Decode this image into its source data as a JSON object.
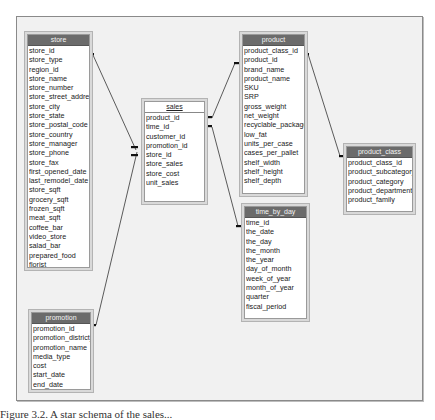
{
  "diagram": {
    "tables": {
      "store": {
        "title": "store",
        "fields": [
          "store_id",
          "store_type",
          "region_id",
          "store_name",
          "store_number",
          "store_street_address",
          "store_city",
          "store_state",
          "store_postal_code",
          "store_country",
          "store_manager",
          "store_phone",
          "store_fax",
          "first_opened_date",
          "last_remodel_date",
          "store_sqft",
          "grocery_sqft",
          "frozen_sqft",
          "meat_sqft",
          "coffee_bar",
          "video_store",
          "salad_bar",
          "prepared_food",
          "florist"
        ]
      },
      "promotion": {
        "title": "promotion",
        "fields": [
          "promotion_id",
          "promotion_district_id",
          "promotion_name",
          "media_type",
          "cost",
          "start_date",
          "end_date"
        ]
      },
      "sales": {
        "title": "sales",
        "fields": [
          "product_id",
          "time_id",
          "customer_id",
          "promotion_id",
          "store_id",
          "store_sales",
          "store_cost",
          "unit_sales"
        ]
      },
      "product": {
        "title": "product",
        "fields": [
          "product_class_id",
          "product_id",
          "brand_name",
          "product_name",
          "SKU",
          "SRP",
          "gross_weight",
          "net_weight",
          "recyclable_package",
          "low_fat",
          "units_per_case",
          "cases_per_pallet",
          "shelf_width",
          "shelf_height",
          "shelf_depth"
        ]
      },
      "time_by_day": {
        "title": "time_by_day",
        "fields": [
          "time_id",
          "the_date",
          "the_day",
          "the_month",
          "the_year",
          "day_of_month",
          "week_of_year",
          "month_of_year",
          "quarter",
          "fiscal_period"
        ]
      },
      "product_class": {
        "title": "product_class",
        "fields": [
          "product_class_id",
          "product_subcategory",
          "product_category",
          "product_department",
          "product_family"
        ]
      }
    },
    "relationships": [
      {
        "from": "store.store_id",
        "to": "sales.store_id"
      },
      {
        "from": "promotion.promotion_id",
        "to": "sales.promotion_id"
      },
      {
        "from": "product.product_id",
        "to": "sales.product_id"
      },
      {
        "from": "time_by_day.time_id",
        "to": "sales.time_id"
      },
      {
        "from": "product_class.product_class_id",
        "to": "product.product_class_id"
      }
    ]
  },
  "caption": "Figure 3.2. A star schema of the sales..."
}
